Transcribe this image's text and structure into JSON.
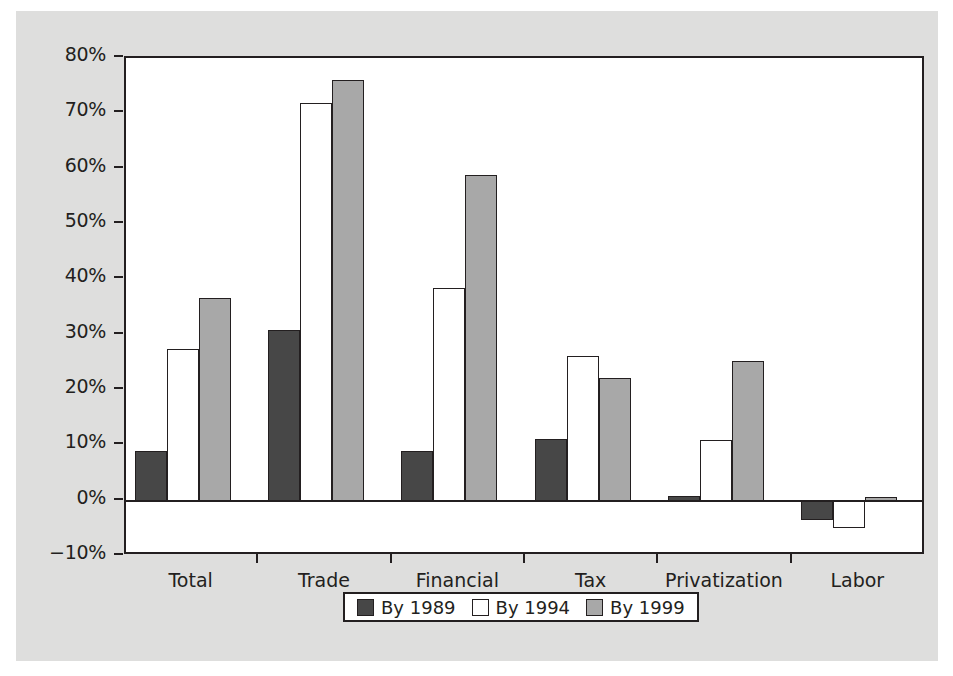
{
  "chart_data": {
    "type": "bar",
    "title": "",
    "subtitle": "",
    "xlabel": "",
    "ylabel": "",
    "categories": [
      "Total",
      "Trade",
      "Financial",
      "Tax",
      "Privatization",
      "Labor"
    ],
    "series": [
      {
        "name": "By 1989",
        "color": "#474747",
        "values": [
          9,
          30.8,
          9,
          11.2,
          0.9,
          -3.5
        ]
      },
      {
        "name": "By 1994",
        "color": "#ffffff",
        "values": [
          27.4,
          71.8,
          38.4,
          26.2,
          11,
          -5
        ]
      },
      {
        "name": "By 1999",
        "color": "#a8a8a8",
        "values": [
          36.7,
          76,
          58.9,
          22.2,
          25.3,
          0.6
        ]
      }
    ],
    "ylim": [
      -10,
      80
    ],
    "ytick_values": [
      80,
      70,
      60,
      50,
      40,
      30,
      20,
      10,
      0,
      -10
    ],
    "ytick_labels": [
      "80%",
      "70%",
      "60%",
      "50%",
      "40%",
      "30%",
      "20%",
      "10%",
      "0%",
      "−10%"
    ],
    "grid": false,
    "legend_position": "bottom-center",
    "value_suffix": "%",
    "colors": {
      "axis": "#231f20",
      "plot_background": "#ffffff",
      "panel_background": "#dededd",
      "page_background": "#ffffff"
    }
  }
}
